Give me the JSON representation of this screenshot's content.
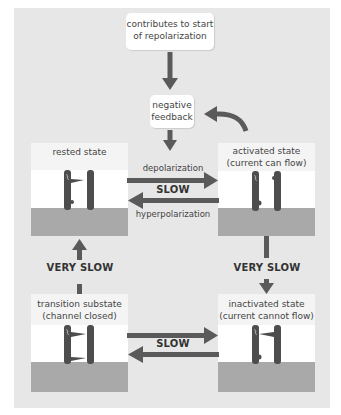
{
  "diagram": {
    "top_box": {
      "line1": "contributes to start",
      "line2": "of repolarization"
    },
    "feedback_box": {
      "line1": "negative",
      "line2": "feedback"
    },
    "states": {
      "rested": {
        "line1": "rested state",
        "line2": ""
      },
      "activated": {
        "line1": "activated state",
        "line2": "(current can flow)"
      },
      "transition": {
        "line1": "transition substate",
        "line2": "(channel closed)"
      },
      "inactivated": {
        "line1": "inactivated state",
        "line2": "(current cannot flow)"
      }
    },
    "transitions": {
      "top_forward": "depolarization",
      "top_speed": "SLOW",
      "top_backward": "hyperpolarization",
      "left_vertical": "VERY SLOW",
      "right_vertical": "VERY SLOW",
      "bottom_speed": "SLOW"
    },
    "colors": {
      "panel": "#e7e7e7",
      "arrow": "#5a5a5a",
      "channel": "#4d4d4d",
      "membrane_lower": "#a9a9a9",
      "label_bg": "#f4f4f4"
    }
  }
}
